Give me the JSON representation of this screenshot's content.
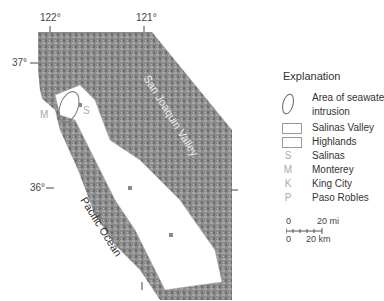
{
  "map": {
    "lon_labels": [
      "122°",
      "121°"
    ],
    "lat_labels": [
      "37°",
      "36°"
    ],
    "region_label": "San Joaquin Valley",
    "ocean_label": "Pacific Ocean",
    "city_markers": [
      {
        "letter": "M",
        "name": "Monterey"
      },
      {
        "letter": "S",
        "name": "Salinas"
      },
      {
        "letter": "K",
        "name": "King City"
      },
      {
        "letter": "P",
        "name": "Paso Robles"
      }
    ],
    "colors": {
      "relief": "#8a8a8a",
      "valley": "#ffffff",
      "symbols": "#aaaaaa"
    }
  },
  "legend": {
    "title": "Explanation",
    "items": [
      {
        "symbol": "ellipse",
        "label_line1": "Area of seawater",
        "label_line2": "intrusion"
      },
      {
        "symbol": "box",
        "label": "Salinas Valley"
      },
      {
        "symbol": "box",
        "label": "Highlands"
      },
      {
        "symbol": "S",
        "label": "Salinas"
      },
      {
        "symbol": "M",
        "label": "Monterey"
      },
      {
        "symbol": "K",
        "label": "King City"
      },
      {
        "symbol": "P",
        "label": "Paso Robles"
      }
    ],
    "scale": {
      "mi_start": "0",
      "mi_end": "20 mi",
      "km_start": "0",
      "km_end": "20 km"
    }
  }
}
